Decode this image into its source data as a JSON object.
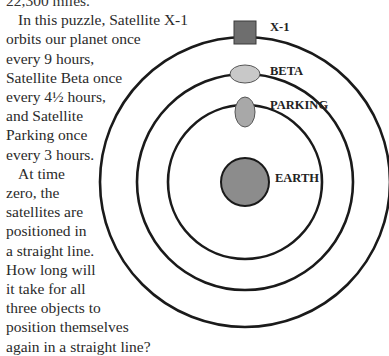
{
  "puzzle_text": {
    "lines": [
      "22,300 miles.",
      "In this puzzle, Satellite X-1",
      "orbits our planet once",
      "every 9 hours,",
      "Satellite Beta once",
      "every 4½ hours,",
      "and Satellite",
      "Parking once",
      "every 3 hours.",
      "At time",
      "zero, the",
      "satellites are",
      "positioned in",
      "a straight line.",
      "How long will",
      "it take for all",
      "three objects to",
      "position themselves",
      "again in a straight line?"
    ]
  },
  "diagram": {
    "labels": {
      "x1": "X-1",
      "beta": "BETA",
      "parking": "PARKING",
      "earth": "EARTH"
    },
    "colors": {
      "x1_fill": "#6e6e6e",
      "beta_fill": "#c8c8c8",
      "parking_fill": "#a8a8a8",
      "earth_fill": "#8c8c8c",
      "orbit_stroke": "#1a1a1a"
    },
    "periods_hours": {
      "x1": "9",
      "beta": "4½",
      "parking": "3"
    }
  }
}
